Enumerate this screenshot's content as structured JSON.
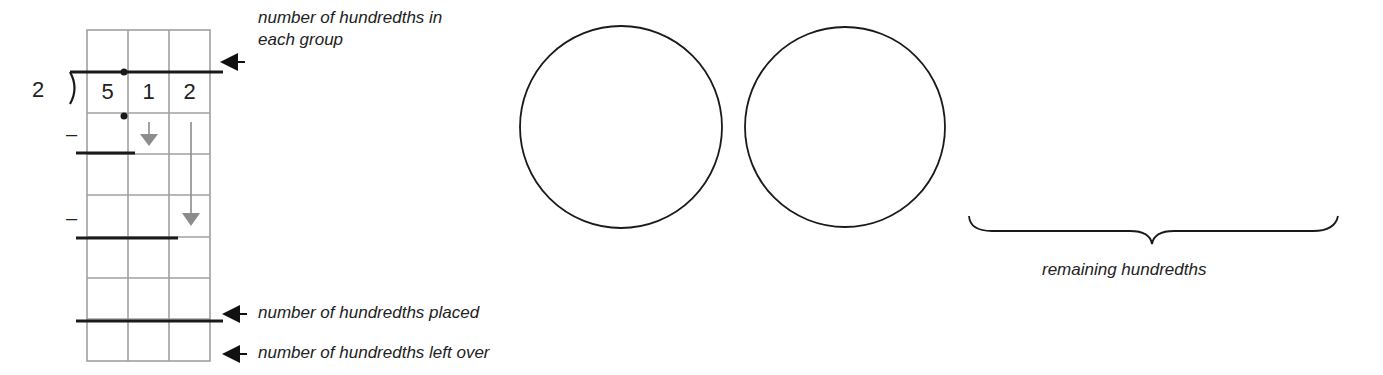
{
  "division": {
    "divisor": "2",
    "dividend_digits": [
      "5",
      "1",
      "2"
    ],
    "minus_signs": [
      "–",
      "–"
    ]
  },
  "annotations": {
    "hundredths_each_group_line1": "number of hundredths in",
    "hundredths_each_group_line2": "each group",
    "hundredths_placed": "number of hundredths placed",
    "hundredths_left_over": "number of hundredths left over"
  },
  "groups": {
    "circle_count": 2,
    "remaining_label": "remaining hundredths"
  },
  "colors": {
    "ink": "#1a1a1a",
    "grid": "#a0a0a0",
    "gray_arrow": "#8c8c8c"
  }
}
